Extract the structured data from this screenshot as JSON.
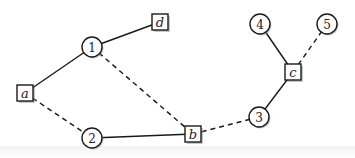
{
  "diagram": {
    "type": "graph",
    "nodes": [
      {
        "id": "a",
        "label": "a",
        "shape": "square",
        "x": 25,
        "y": 93
      },
      {
        "id": "1",
        "label": "1",
        "shape": "circle",
        "x": 92,
        "y": 47
      },
      {
        "id": "d",
        "label": "d",
        "shape": "square",
        "x": 160,
        "y": 22
      },
      {
        "id": "2",
        "label": "2",
        "shape": "circle",
        "x": 92,
        "y": 138
      },
      {
        "id": "b",
        "label": "b",
        "shape": "square",
        "x": 193,
        "y": 134
      },
      {
        "id": "3",
        "label": "3",
        "shape": "circle",
        "x": 259,
        "y": 117
      },
      {
        "id": "c",
        "label": "c",
        "shape": "square",
        "x": 293,
        "y": 72
      },
      {
        "id": "4",
        "label": "4",
        "shape": "circle",
        "x": 260,
        "y": 24
      },
      {
        "id": "5",
        "label": "5",
        "shape": "circle",
        "x": 327,
        "y": 24
      }
    ],
    "edges": [
      {
        "from": "a",
        "to": "1",
        "style": "solid"
      },
      {
        "from": "1",
        "to": "d",
        "style": "solid"
      },
      {
        "from": "a",
        "to": "2",
        "style": "dashed"
      },
      {
        "from": "1",
        "to": "b",
        "style": "dashed"
      },
      {
        "from": "2",
        "to": "b",
        "style": "solid"
      },
      {
        "from": "b",
        "to": "3",
        "style": "dashed"
      },
      {
        "from": "3",
        "to": "c",
        "style": "solid"
      },
      {
        "from": "c",
        "to": "4",
        "style": "solid"
      },
      {
        "from": "c",
        "to": "5",
        "style": "dashed"
      }
    ]
  }
}
